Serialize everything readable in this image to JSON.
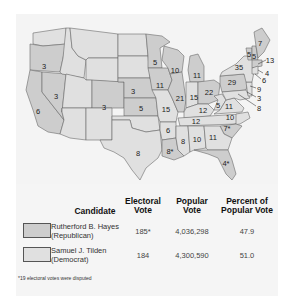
{
  "title_fragment": "Map: 1876 Presidential Election",
  "colors": {
    "republican_fill": "#cdcdcd",
    "democrat_fill": "#e0e0e0",
    "border": "#6a6a6a",
    "panel_bg": "#f4f4f4"
  },
  "map": {
    "states": [
      {
        "name": "Oregon",
        "votes": "3",
        "party": "R",
        "x": 44,
        "y": 66
      },
      {
        "name": "California",
        "votes": "6",
        "party": "R",
        "x": 38,
        "y": 111
      },
      {
        "name": "Nevada",
        "votes": "3",
        "party": "R",
        "x": 56,
        "y": 96
      },
      {
        "name": "Colorado",
        "votes": "3",
        "party": "R",
        "x": 104,
        "y": 107
      },
      {
        "name": "Nebraska",
        "votes": "3",
        "party": "R",
        "x": 133,
        "y": 91
      },
      {
        "name": "Kansas",
        "votes": "5",
        "party": "R",
        "x": 141,
        "y": 108
      },
      {
        "name": "Minnesota",
        "votes": "5",
        "party": "R",
        "x": 155,
        "y": 62
      },
      {
        "name": "Iowa",
        "votes": "11",
        "party": "R",
        "x": 160,
        "y": 85
      },
      {
        "name": "Missouri",
        "votes": "15",
        "party": "D",
        "x": 166,
        "y": 109
      },
      {
        "name": "Wisconsin",
        "votes": "10",
        "party": "R",
        "x": 175,
        "y": 70
      },
      {
        "name": "Illinois",
        "votes": "21",
        "party": "R",
        "x": 180,
        "y": 98
      },
      {
        "name": "Michigan",
        "votes": "11",
        "party": "R",
        "x": 197,
        "y": 75
      },
      {
        "name": "Indiana",
        "votes": "15",
        "party": "D",
        "x": 194,
        "y": 97
      },
      {
        "name": "Ohio",
        "votes": "22",
        "party": "R",
        "x": 209,
        "y": 92
      },
      {
        "name": "Kentucky",
        "votes": "12",
        "party": "D",
        "x": 203,
        "y": 110
      },
      {
        "name": "West Virginia",
        "votes": "5",
        "party": "D",
        "x": 218,
        "y": 105
      },
      {
        "name": "Virginia",
        "votes": "11",
        "party": "D",
        "x": 229,
        "y": 106
      },
      {
        "name": "Pennsylvania",
        "votes": "29",
        "party": "R",
        "x": 232,
        "y": 82
      },
      {
        "name": "New York",
        "votes": "35",
        "party": "D",
        "x": 239,
        "y": 67
      },
      {
        "name": "Vermont",
        "votes": "5",
        "party": "R",
        "x": 249,
        "y": 54
      },
      {
        "name": "New Hampshire",
        "votes": "5",
        "party": "R",
        "x": 254,
        "y": 56
      },
      {
        "name": "Maine",
        "votes": "7",
        "party": "R",
        "x": 260,
        "y": 43
      },
      {
        "name": "North Carolina",
        "votes": "10",
        "party": "D",
        "x": 230,
        "y": 117
      },
      {
        "name": "Tennessee",
        "votes": "12",
        "party": "D",
        "x": 196,
        "y": 121
      },
      {
        "name": "South Carolina",
        "votes": "7*",
        "party": "R",
        "x": 227,
        "y": 128
      },
      {
        "name": "Arkansas",
        "votes": "6",
        "party": "D",
        "x": 168,
        "y": 130
      },
      {
        "name": "Mississippi",
        "votes": "8",
        "party": "D",
        "x": 183,
        "y": 141
      },
      {
        "name": "Alabama",
        "votes": "10",
        "party": "D",
        "x": 197,
        "y": 139
      },
      {
        "name": "Georgia",
        "votes": "11",
        "party": "D",
        "x": 213,
        "y": 137
      },
      {
        "name": "Louisiana",
        "votes": "8*",
        "party": "R",
        "x": 170,
        "y": 151
      },
      {
        "name": "Texas",
        "votes": "8",
        "party": "D",
        "x": 138,
        "y": 153
      },
      {
        "name": "Florida",
        "votes": "4*",
        "party": "R",
        "x": 226,
        "y": 163
      }
    ],
    "callouts": [
      {
        "name": "Massachusetts",
        "votes": "13",
        "x": 270,
        "y": 60
      },
      {
        "name": "Rhode Island",
        "votes": "4",
        "x": 267,
        "y": 73
      },
      {
        "name": "Connecticut",
        "votes": "6",
        "x": 264,
        "y": 80
      },
      {
        "name": "New Jersey",
        "votes": "9",
        "x": 259,
        "y": 89
      },
      {
        "name": "Delaware",
        "votes": "3",
        "x": 259,
        "y": 98
      },
      {
        "name": "Maryland",
        "votes": "8",
        "x": 259,
        "y": 108
      }
    ]
  },
  "table": {
    "headers": {
      "candidate": "Candidate",
      "electoral_1": "Electoral",
      "electoral_2": "Vote",
      "popular_1": "Popular",
      "popular_2": "Vote",
      "percent_1": "Percent of",
      "percent_2": "Popular Vote"
    },
    "rows": [
      {
        "name_1": "Rutherford B. Hayes",
        "name_2": "(Republican)",
        "electoral": "185*",
        "popular": "4,036,298",
        "percent": "47.9"
      },
      {
        "name_1": "Samuel J. Tilden",
        "name_2": "(Democrat)",
        "electoral": "184",
        "popular": "4,300,590",
        "percent": "51.0"
      }
    ]
  },
  "footnote": "*19 electoral votes were disputed"
}
